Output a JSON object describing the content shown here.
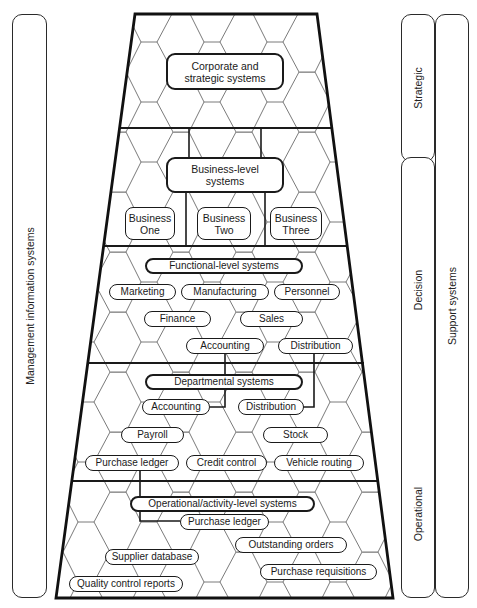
{
  "left_panel": {
    "label": "Management information systems"
  },
  "right_panels": {
    "strategic": {
      "label": "Strategic"
    },
    "decision_operational": {
      "labels": [
        "Decision",
        "Operational"
      ]
    },
    "support": {
      "label": "Support systems"
    }
  },
  "levels": {
    "corporate": {
      "title": "Corporate and strategic systems"
    },
    "business": {
      "title": "Business-level systems",
      "items": [
        "Business One",
        "Business Two",
        "Business Three"
      ]
    },
    "functional": {
      "title": "Functional-level systems",
      "items": [
        "Marketing",
        "Manufacturing",
        "Personnel",
        "Finance",
        "Sales",
        "Accounting",
        "Distribution"
      ]
    },
    "departmental": {
      "title": "Departmental systems",
      "items": [
        "Accounting",
        "Distribution",
        "Payroll",
        "Stock",
        "Purchase ledger",
        "Credit control",
        "Vehicle routing"
      ]
    },
    "operational": {
      "title": "Operational/activity-level systems",
      "items": [
        "Purchase ledger",
        "Outstanding orders",
        "Supplier database",
        "Purchase requisitions",
        "Quality control reports"
      ]
    }
  },
  "connectors": [
    "Business-level systems -> Business One/Two/Three",
    "Functional Accounting -> Departmental Accounting",
    "Functional Distribution -> Departmental Distribution",
    "Departmental Purchase ledger -> Operational Purchase ledger"
  ],
  "colors": {
    "line": "#1a1a1a",
    "hex_grid": "#555555",
    "background": "#ffffff"
  }
}
